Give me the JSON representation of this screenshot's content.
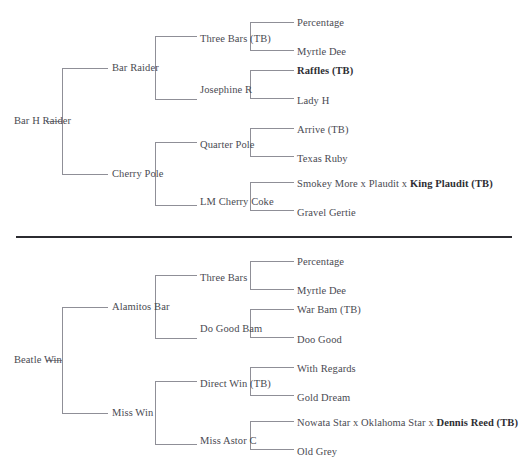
{
  "page": {
    "line_color": "#8f8f97",
    "text_color": "#4a4a52",
    "bold_text_color": "#2e2e33",
    "divider_color": "#2b2b30",
    "background": "#ffffff"
  },
  "charts": [
    {
      "id": "bar-h-raider",
      "root": "Bar H Raider",
      "parents": [
        "Bar Raider",
        "Cherry Pole"
      ],
      "grandparents": [
        "Three Bars (TB)",
        "Josephine R",
        "Quarter Pole",
        "LM Cherry Coke"
      ],
      "great_grandparents": [
        {
          "text": "Percentage",
          "bold": false
        },
        {
          "text": "Myrtle Dee",
          "bold": false
        },
        {
          "text": "Raffles (TB)",
          "bold": true
        },
        {
          "text": "Lady H",
          "bold": false
        },
        {
          "text": "Arrive (TB)",
          "bold": false
        },
        {
          "text": "Texas Ruby",
          "bold": false
        },
        {
          "text": "Smokey More x Plaudit x ",
          "bold_suffix": "King Plaudit (TB)",
          "bold": false
        },
        {
          "text": "Gravel Gertie",
          "bold": false
        }
      ]
    },
    {
      "id": "beatle-win",
      "root": "Beatle Win",
      "parents": [
        "Alamitos Bar",
        "Miss Win"
      ],
      "grandparents": [
        "Three Bars",
        "Do Good Bam",
        "Direct Win (TB)",
        "Miss Astor C"
      ],
      "great_grandparents": [
        {
          "text": "Percentage",
          "bold": false
        },
        {
          "text": "Myrtle Dee",
          "bold": false
        },
        {
          "text": "War Bam (TB)",
          "bold": false
        },
        {
          "text": "Doo Good",
          "bold": false
        },
        {
          "text": "With Regards",
          "bold": false
        },
        {
          "text": "Gold Dream",
          "bold": false
        },
        {
          "text": "Nowata Star x Oklahoma Star x ",
          "bold_suffix": "Dennis Reed (TB)",
          "bold": false
        },
        {
          "text": "Old Grey",
          "bold": false
        }
      ]
    }
  ]
}
